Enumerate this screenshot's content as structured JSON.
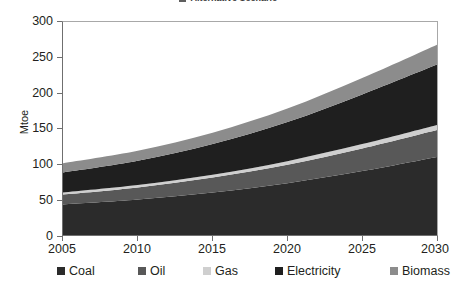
{
  "title": {
    "text": "Alternative Scenario",
    "swatch_color": "#5f5f5f"
  },
  "axes": {
    "ylabel": "Mtoe",
    "yticks": [
      "0",
      "50",
      "100",
      "150",
      "200",
      "250",
      "300"
    ],
    "xticks": [
      "2005",
      "2010",
      "2015",
      "2020",
      "2025",
      "2030"
    ]
  },
  "legend": [
    {
      "label": "Coal",
      "color": "#2b2b2b"
    },
    {
      "label": "Oil",
      "color": "#585858"
    },
    {
      "label": "Gas",
      "color": "#cfcfcf"
    },
    {
      "label": "Electricity",
      "color": "#1f1f1f"
    },
    {
      "label": "Biomass",
      "color": "#8c8c8c"
    }
  ],
  "chart_data": {
    "type": "area",
    "title": "Alternative Scenario",
    "xlabel": "",
    "ylabel": "Mtoe",
    "xlim": [
      2005,
      2030
    ],
    "ylim": [
      0,
      300
    ],
    "grid": false,
    "legend_position": "bottom",
    "stacked": true,
    "stack_order_bottom_to_top": [
      "Coal",
      "Oil",
      "Gas",
      "Electricity",
      "Biomass"
    ],
    "x": [
      2005,
      2010,
      2015,
      2020,
      2025,
      2030
    ],
    "series": [
      {
        "name": "Coal",
        "color": "#2b2b2b",
        "values": [
          43,
          50,
          60,
          73,
          90,
          110
        ]
      },
      {
        "name": "Oil",
        "color": "#585858",
        "values": [
          14,
          17,
          21,
          26,
          32,
          38
        ]
      },
      {
        "name": "Gas",
        "color": "#cfcfcf",
        "values": [
          3,
          3.5,
          4,
          5,
          6,
          7
        ]
      },
      {
        "name": "Electricity",
        "color": "#1f1f1f",
        "values": [
          28,
          34,
          43,
          55,
          70,
          85
        ]
      },
      {
        "name": "Biomass",
        "color": "#8c8c8c",
        "values": [
          13,
          14,
          16,
          19,
          23,
          28
        ]
      }
    ],
    "totals": [
      101,
      118.5,
      144,
      178,
      221,
      268
    ]
  }
}
